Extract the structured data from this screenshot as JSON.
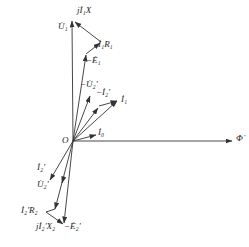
{
  "diagram": {
    "origin_label": "O",
    "phasors": [
      {
        "id": "U1",
        "label": "U̇₁",
        "from": [
          73,
          141
        ],
        "to": [
          72,
          20
        ]
      },
      {
        "id": "jI1X",
        "label": "jİ₁X",
        "from": [
          101,
          42
        ],
        "to": [
          74,
          21
        ]
      },
      {
        "id": "I1R1",
        "label": "İ₁R₁",
        "from": [
          86,
          54
        ],
        "to": [
          101,
          42
        ]
      },
      {
        "id": "negE1",
        "label": "−Ė₁",
        "from": [
          73,
          141
        ],
        "to": [
          86,
          54
        ]
      },
      {
        "id": "negU2p",
        "label": "−U̇₂′",
        "from": [
          73,
          141
        ],
        "to": [
          90,
          95
        ]
      },
      {
        "id": "negI2p",
        "label": "−İ₂′",
        "from": [
          73,
          141
        ],
        "to": [
          99,
          106
        ]
      },
      {
        "id": "I1",
        "label": "İ₁",
        "from": [
          73,
          141
        ],
        "to": [
          118,
          100
        ]
      },
      {
        "id": "I0",
        "label": "İ₀",
        "from": [
          73,
          141
        ],
        "to": [
          96,
          135
        ]
      },
      {
        "id": "Phi",
        "label": "Φ̇",
        "from": [
          73,
          141
        ],
        "to": [
          232,
          141
        ]
      },
      {
        "id": "I2p",
        "label": "İ₂′",
        "from": [
          73,
          141
        ],
        "to": [
          50,
          180
        ]
      },
      {
        "id": "U2p",
        "label": "U̇₂′",
        "from": [
          73,
          141
        ],
        "to": [
          55,
          210
        ]
      },
      {
        "id": "I2pR2",
        "label": "İ₂′R₂",
        "from": [
          55,
          210
        ],
        "to": [
          46,
          212
        ]
      },
      {
        "id": "jI2pX2",
        "label": "jİ₂′X₂",
        "from": [
          46,
          212
        ],
        "to": [
          63,
          224
        ]
      },
      {
        "id": "negE2p",
        "label": "−Ė₂′",
        "from": [
          73,
          141
        ],
        "to": [
          63,
          224
        ]
      }
    ],
    "labels": {
      "U1": "U̇₁",
      "jI1X": "jİ₁X",
      "I1R1": "İ₁R₁",
      "negE1": "−Ė₁",
      "negU2p": "−U̇₂′",
      "negI2p": "−İ₂′",
      "I1": "İ₁",
      "O": "O",
      "I0": "İ₀",
      "Phi": "Φ̇",
      "I2p": "İ₂′",
      "U2p": "U̇₂′",
      "I2pR2": "İ₂′R₂",
      "jI2pX2": "jİ₂′X₂",
      "negE2p": "−Ė₂′"
    },
    "colors": {
      "line": "#333333",
      "text": "#222222",
      "background": "#ffffff"
    }
  }
}
